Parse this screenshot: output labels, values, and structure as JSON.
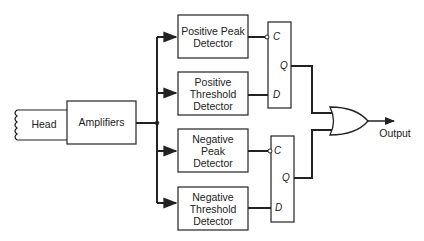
{
  "diagram": {
    "type": "block-diagram",
    "head": {
      "label": "Head"
    },
    "amplifier": {
      "label": "Amplifiers"
    },
    "detectors": [
      {
        "label": "Positive Peak Detector",
        "lines": [
          "Positive Peak",
          "Detector"
        ]
      },
      {
        "label": "Positive Threshold Detector",
        "lines": [
          "Positive",
          "Threshold",
          "Detector"
        ]
      },
      {
        "label": "Negative Peak Detector",
        "lines": [
          "Negative",
          "Peak",
          "Detector"
        ]
      },
      {
        "label": "Negative Threshold Detector",
        "lines": [
          "Negative",
          "Threshold",
          "Detector"
        ]
      }
    ],
    "flipflops": [
      {
        "pins": {
          "clock": "C",
          "output": "Q",
          "data": "D"
        }
      },
      {
        "pins": {
          "clock": "C",
          "output": "Q",
          "data": "D"
        }
      }
    ],
    "or_gate": {
      "label": "OR"
    },
    "output": {
      "label": "Output"
    },
    "colors": {
      "line": "#222222",
      "background": "#ffffff"
    }
  }
}
